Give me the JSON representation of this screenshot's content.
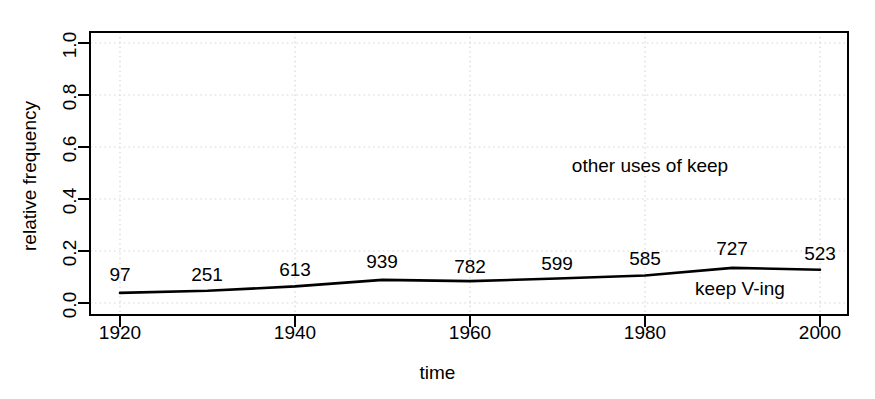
{
  "chart_data": {
    "type": "line",
    "title": "",
    "xlabel": "time",
    "ylabel": "relative frequency",
    "xlim": [
      1915,
      2005
    ],
    "ylim": [
      0.0,
      1.0
    ],
    "grid": true,
    "legend_position": "inline-annotations",
    "x": [
      1920,
      1930,
      1940,
      1950,
      1960,
      1970,
      1980,
      1990,
      2000
    ],
    "xticks": [
      "1920",
      "1940",
      "1960",
      "1980",
      "2000"
    ],
    "xtick_values": [
      1920,
      1940,
      1960,
      1980,
      2000
    ],
    "yticks": [
      "0.0",
      "0.2",
      "0.4",
      "0.6",
      "0.8",
      "1.0"
    ],
    "ytick_values": [
      0.0,
      0.2,
      0.4,
      0.6,
      0.8,
      1.0
    ],
    "series": [
      {
        "name": "keep V-ing",
        "values": [
          0.039,
          0.047,
          0.064,
          0.089,
          0.084,
          0.094,
          0.106,
          0.135,
          0.128
        ],
        "counts": [
          97,
          251,
          613,
          939,
          782,
          599,
          585,
          727,
          523
        ],
        "color": "#000000"
      }
    ],
    "annotations": [
      {
        "text": "other uses of keep",
        "x": 1974,
        "y": 0.6
      },
      {
        "text": "keep V-ing",
        "x": 1991,
        "y": 0.055
      }
    ],
    "point_labels": [
      "97",
      "251",
      "613",
      "939",
      "782",
      "599",
      "585",
      "727",
      "523"
    ]
  }
}
